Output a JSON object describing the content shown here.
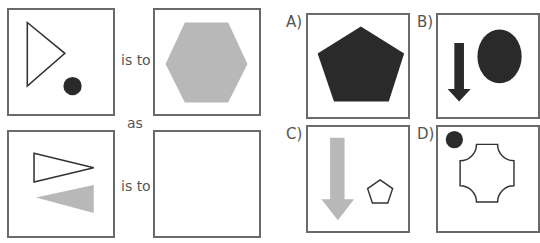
{
  "analogy": {
    "connector_1": "is to",
    "connector_2": "as",
    "connector_3": "is to",
    "panels": [
      {
        "id": "premise-1",
        "contents": [
          "outlined right-pointing triangle",
          "small dark filled circle"
        ]
      },
      {
        "id": "premise-2",
        "contents": [
          "large gray filled hexagon"
        ]
      },
      {
        "id": "query",
        "contents": [
          "outlined right-pointing triangle",
          "gray filled left-pointing triangle"
        ]
      },
      {
        "id": "answer",
        "contents": []
      }
    ]
  },
  "options": [
    {
      "label": "A)",
      "contents": [
        "large dark filled pentagon"
      ]
    },
    {
      "label": "B)",
      "contents": [
        "dark downward arrow",
        "dark filled oval"
      ]
    },
    {
      "label": "C)",
      "contents": [
        "gray downward arrow",
        "small outlined pentagon"
      ]
    },
    {
      "label": "D)",
      "contents": [
        "small dark filled circle",
        "outlined cross-shape with concave corners"
      ]
    }
  ],
  "colors": {
    "border": "#6a6a6a",
    "dark": "#2a2a2a",
    "gray": "#b8b8b8",
    "outline": "#333333"
  }
}
